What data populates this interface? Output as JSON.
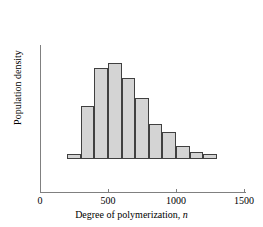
{
  "chart_data": {
    "type": "bar",
    "title": "",
    "subtitle": "",
    "xlabel": "Degree of polymerization, n",
    "ylabel": "Population density",
    "xlim": [
      0,
      1500
    ],
    "ylim": [
      0,
      1.0
    ],
    "grid": false,
    "legend": null,
    "xticks": [
      0,
      500,
      1000,
      1500
    ],
    "xticklabels": [
      "0",
      "500",
      "1000",
      "1500"
    ],
    "yticks": [],
    "yticklabels": [],
    "bin_width": 100,
    "bin_edges": [
      200,
      300,
      400,
      500,
      600,
      700,
      800,
      900,
      1000,
      1100,
      1200,
      1300
    ],
    "categories": [
      "200-300",
      "300-400",
      "400-500",
      "500-600",
      "600-700",
      "700-800",
      "800-900",
      "900-1000",
      "1000-1100",
      "1100-1200",
      "1200-1300"
    ],
    "values": [
      0.05,
      0.52,
      0.89,
      0.94,
      0.79,
      0.6,
      0.34,
      0.26,
      0.13,
      0.07,
      0.05
    ],
    "bar_facecolor": "#d4d4d4",
    "bar_edgecolor": "#404040",
    "axis_color": "#808080"
  },
  "axis": {
    "x_tick_labels": [
      "0",
      "500",
      "1000",
      "1500"
    ],
    "x_axis_title_prefix": "Degree of polymerization, ",
    "x_axis_title_italic": "n",
    "y_axis_title": "Population density"
  }
}
